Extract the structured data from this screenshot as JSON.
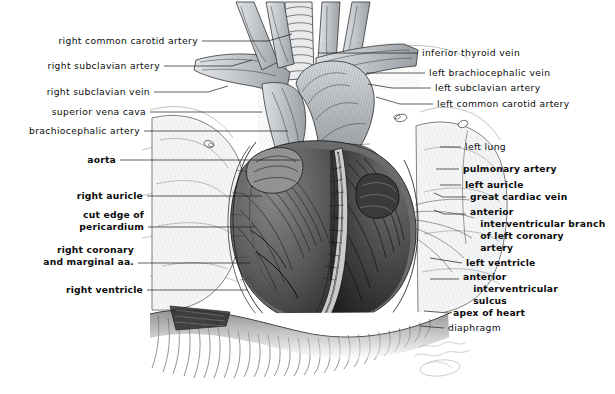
{
  "figure": {
    "signature": "artist-signature",
    "ink_color": "#1d1d1d",
    "paper_color": "#ffffff",
    "vessel_fill": "#c9cdd1",
    "muscle_shade": "#4a4a4a"
  },
  "labels_left": [
    {
      "id": "right-common-carotid-artery",
      "text": "right common carotid artery",
      "bold": false,
      "x": 198,
      "y": 41,
      "leader": "M 202,41 L 268,41 L 292,34"
    },
    {
      "id": "right-subclavian-artery",
      "text": "right subclavian artery",
      "bold": false,
      "x": 160,
      "y": 66,
      "leader": "M 164,66 L 232,66 L 252,60"
    },
    {
      "id": "right-subclavian-vein",
      "text": "right subclavian vein",
      "bold": false,
      "x": 150,
      "y": 92,
      "leader": "M 154,92 L 208,92 L 228,86"
    },
    {
      "id": "superior-vena-cava",
      "text": "superior vena cava",
      "bold": false,
      "x": 146,
      "y": 112,
      "leader": "M 150,112 L 262,112"
    },
    {
      "id": "brachiocephalic-artery",
      "text": "brachiocephalic artery",
      "bold": false,
      "x": 140,
      "y": 131,
      "leader": "M 144,131 L 288,131"
    },
    {
      "id": "aorta",
      "text": "aorta",
      "bold": true,
      "x": 116,
      "y": 160,
      "leader": "M 120,160 L 300,160"
    },
    {
      "id": "right-auricle",
      "text": "right auricle",
      "bold": true,
      "x": 143,
      "y": 196,
      "leader": "M 147,196 L 262,196"
    },
    {
      "id": "cut-edge-of-pericardium",
      "text": "cut edge of\npericardium",
      "bold": true,
      "x": 144,
      "y": 215,
      "leader": "M 148,227 L 255,227"
    },
    {
      "id": "right-coronary-and-marginal-aa",
      "text": "right coronary\nand marginal aa.",
      "bold": true,
      "x": 134,
      "y": 250,
      "leader": "M 138,263 L 250,263"
    },
    {
      "id": "right-ventricle",
      "text": "right ventricle",
      "bold": true,
      "x": 143,
      "y": 290,
      "leader": "M 147,290 L 248,290"
    }
  ],
  "labels_right": [
    {
      "id": "inferior-thyroid-vein",
      "text": "inferior thyroid vein",
      "bold": false,
      "x": 422,
      "y": 53,
      "leader": "M 418,53 L 318,53"
    },
    {
      "id": "left-brachiocephalic-vein",
      "text": "left brachiocephalic vein",
      "bold": false,
      "x": 429,
      "y": 73,
      "leader": "M 425,73 L 366,73"
    },
    {
      "id": "left-subclavian-artery",
      "text": "left subclavian artery",
      "bold": false,
      "x": 435,
      "y": 88,
      "leader": "M 431,88 L 392,88 L 368,84"
    },
    {
      "id": "left-common-carotid-artery",
      "text": "left common carotid artery",
      "bold": false,
      "x": 437,
      "y": 104,
      "leader": "M 433,104 L 400,104 L 376,97"
    },
    {
      "id": "left-lung",
      "text": "left lung",
      "bold": false,
      "x": 465,
      "y": 147,
      "leader": "M 461,147 L 440,147"
    },
    {
      "id": "pulmonary-artery",
      "text": "pulmonary artery",
      "bold": true,
      "x": 463,
      "y": 169,
      "leader": "M 459,169 L 436,169"
    },
    {
      "id": "left-auricle",
      "text": "left auricle",
      "bold": true,
      "x": 465,
      "y": 185,
      "leader": "M 461,185 L 440,185"
    },
    {
      "id": "great-cardiac-vein",
      "text": "great cardiac vein",
      "bold": true,
      "x": 470,
      "y": 197,
      "leader": "M 466,197 L 443,197 L 434,193"
    },
    {
      "id": "anterior-interventricular-branch-of-left-coronary-artery",
      "text": "anterior\n   interventricular branch\n   of left coronary\n   artery",
      "bold": true,
      "x": 470,
      "y": 212,
      "leader": "M 466,214 L 444,214 L 434,210"
    },
    {
      "id": "left-ventricle",
      "text": "left ventricle",
      "bold": true,
      "x": 466,
      "y": 263,
      "leader": "M 462,263 L 430,258"
    },
    {
      "id": "anterior-interventricular-sulcus",
      "text": "anterior\n   interventricular\n   sulcus",
      "bold": true,
      "x": 463,
      "y": 277,
      "leader": "M 459,279 L 430,279"
    },
    {
      "id": "apex-of-heart",
      "text": "apex of heart",
      "bold": true,
      "x": 453,
      "y": 313,
      "leader": "M 449,313 L 424,311"
    },
    {
      "id": "diaphragm",
      "text": "diaphragm",
      "bold": false,
      "x": 448,
      "y": 328,
      "leader": "M 444,328 L 420,326"
    }
  ]
}
